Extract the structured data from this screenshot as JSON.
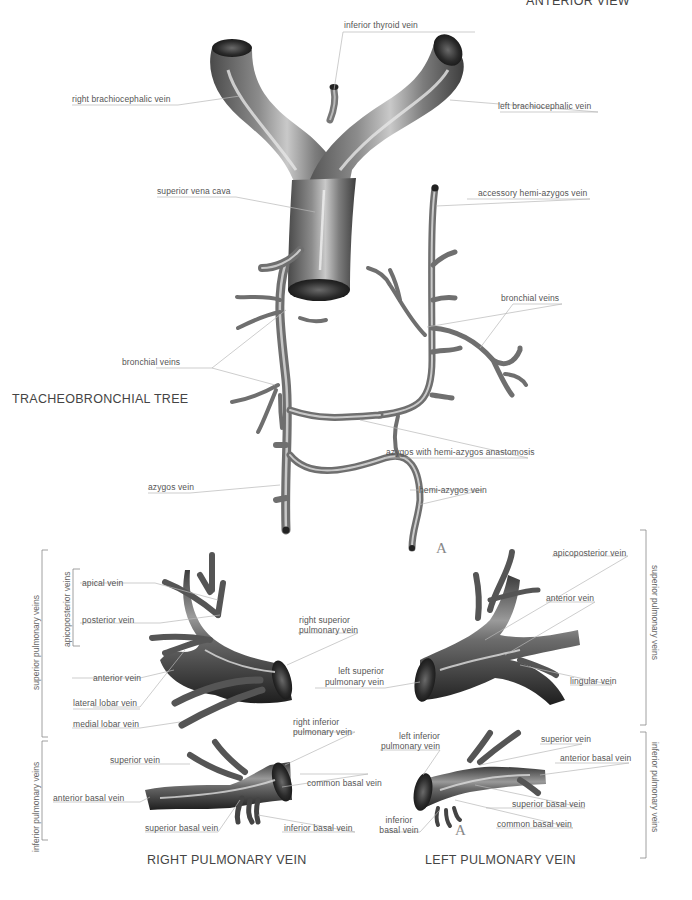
{
  "header": {
    "view_title": "ANTERIOR VIEW"
  },
  "colors": {
    "vein_dark": "#3a3a3a",
    "vein_mid": "#7a7a7a",
    "vein_light": "#d8d8d8",
    "leader": "#b8b8b8",
    "text": "#555555"
  },
  "upper": {
    "section_title": "TRACHEOBRONCHIAL TREE",
    "labels": {
      "inferior_thyroid_vein": "inferior thyroid vein",
      "right_brachiocephalic_vein": "right brachiocephalic vein",
      "left_brachiocephalic_vein": "left brachiocephalic vein",
      "superior_vena_cava": "superior vena cava",
      "accessory_hemi_azygos_vein": "accessory hemi-azygos vein",
      "bronchial_veins_right": "bronchial veins",
      "bronchial_veins_left": "bronchial veins",
      "azygos_anastomosis": "azygos with hemi-azygos anastomosis",
      "azygos_vein": "azygos vein",
      "hemi_azygos_vein": "hemi-azygos vein"
    },
    "marker": "A"
  },
  "right_pulmonary": {
    "section_title": "RIGHT PULMONARY VEIN",
    "brackets": {
      "superior": "superior pulmonary veins",
      "apicoposterior": "apicoposterior veins",
      "inferior": "inferior pulmonary veins"
    },
    "labels": {
      "apical_vein": "apical vein",
      "posterior_vein": "posterior vein",
      "anterior_vein": "anterior vein",
      "lateral_lobar_vein": "lateral lobar vein",
      "medial_lobar_vein": "medial lobar vein",
      "right_superior_pulmonary_vein_1": "right superior",
      "right_superior_pulmonary_vein_2": "pulmonary vein",
      "right_inferior_pulmonary_vein_1": "right inferior",
      "right_inferior_pulmonary_vein_2": "pulmonary vein",
      "superior_vein": "superior vein",
      "anterior_basal_vein": "anterior basal vein",
      "superior_basal_vein": "superior basal vein",
      "common_basal_vein": "common basal vein",
      "inferior_basal_vein": "inferior basal vein"
    }
  },
  "left_pulmonary": {
    "section_title": "LEFT PULMONARY VEIN",
    "brackets": {
      "superior": "superior pulmonary veins",
      "inferior": "inferior pulmonary veins"
    },
    "labels": {
      "apicoposterior_vein": "apicoposterior vein",
      "anterior_vein": "anterior vein",
      "left_superior_pulmonary_vein_1": "left superior",
      "left_superior_pulmonary_vein_2": "pulmonary vein",
      "lingular_vein": "lingular vein",
      "left_inferior_pulmonary_vein_1": "left inferior",
      "left_inferior_pulmonary_vein_2": "pulmonary vein",
      "superior_vein": "superior vein",
      "anterior_basal_vein": "anterior basal vein",
      "superior_basal_vein": "superior basal vein",
      "inferior_basal_vein_1": "inferior",
      "inferior_basal_vein_2": "basal vein",
      "common_basal_vein": "common basal vein"
    },
    "marker": "A"
  }
}
